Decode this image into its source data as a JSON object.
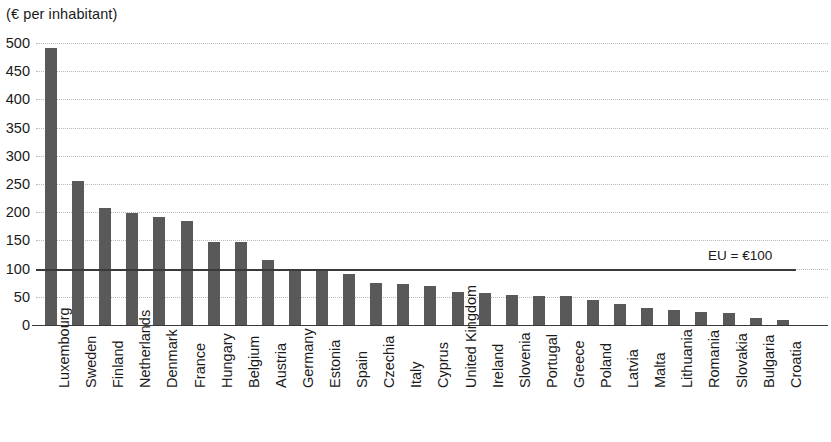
{
  "chart_data": {
    "type": "bar",
    "title": "",
    "subtitle": "",
    "unit_label": "(€ per inhabitant)",
    "xlabel": "",
    "ylabel": "",
    "ylim": [
      0,
      500
    ],
    "ytick_step": 50,
    "yticks": [
      "500",
      "450",
      "400",
      "350",
      "300",
      "250",
      "200",
      "150",
      "100",
      "50",
      "0"
    ],
    "grid": true,
    "grid_axis": "y",
    "legend": null,
    "bar_color": "#595959",
    "reference_line": {
      "label": "EU = €100",
      "value": 100,
      "color": "#3a3a3a"
    },
    "categories": [
      "Luxembourg",
      "Sweden",
      "Finland",
      "Netherlands",
      "Denmark",
      "France",
      "Hungary",
      "Belgium",
      "Austria",
      "Germany",
      "Estonia",
      "Spain",
      "Czechia",
      "Italy",
      "Cyprus",
      "United Kingdom",
      "Ireland",
      "Slovenia",
      "Portugal",
      "Greece",
      "Poland",
      "Latvia",
      "Malta",
      "Lithuania",
      "Romania",
      "Slovakia",
      "Bulgaria",
      "Croatia"
    ],
    "values": [
      491,
      255,
      208,
      199,
      192,
      184,
      148,
      148,
      115,
      100,
      99,
      91,
      74,
      72,
      69,
      58,
      56,
      54,
      52,
      52,
      45,
      37,
      30,
      27,
      23,
      21,
      13,
      9
    ]
  }
}
